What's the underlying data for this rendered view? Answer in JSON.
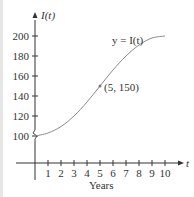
{
  "chart_data": {
    "type": "line",
    "title": "",
    "xlabel": "Years",
    "ylabel": "I(t)",
    "x_axis_symbol": "t",
    "curve_label": "y = I(t)",
    "xlim": [
      0,
      10
    ],
    "ylim": [
      100,
      200
    ],
    "x_ticks": [
      "1",
      "2",
      "3",
      "4",
      "5",
      "6",
      "7",
      "8",
      "9",
      "10"
    ],
    "y_ticks": [
      "100",
      "120",
      "140",
      "160",
      "180",
      "200"
    ],
    "axis_break_on_y": true,
    "grid": false,
    "annotations": [
      {
        "label": "(5, 150)",
        "x": 5,
        "y": 150
      }
    ],
    "series": [
      {
        "name": "I(t)",
        "x": [
          0,
          1,
          2,
          3,
          4,
          5,
          6,
          7,
          8,
          9,
          10
        ],
        "values": [
          100,
          103,
          109.5,
          120,
          134,
          150,
          166,
          180,
          191,
          198,
          200
        ]
      }
    ]
  },
  "colors": {
    "axis": "#333333",
    "curve": "#8a8a8a",
    "point": "#777777"
  }
}
